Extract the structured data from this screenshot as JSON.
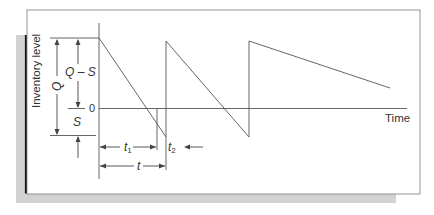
{
  "diagram": {
    "y_axis_label": "Inventory level",
    "x_axis_label": "Time",
    "zero_label": "0",
    "labels": {
      "Q": "Q",
      "Q_minus_S": "Q – S",
      "S": "S",
      "t1": "t",
      "t1_sub": "1",
      "t2": "t",
      "t2_sub": "2",
      "t": "t"
    },
    "colors": {
      "line": "#555555",
      "frame": "#8a8a8a",
      "shadow_dark": "#111111",
      "shadow_light": "#cfcfcf",
      "text": "#333333"
    },
    "cycles": [
      {
        "start_x": 99,
        "end_x": 166,
        "peak": "Q - S",
        "trough": "-S"
      },
      {
        "start_x": 166,
        "end_x": 249,
        "peak": "Q - S",
        "trough": "-S"
      },
      {
        "start_x": 249,
        "end_x": 390,
        "peak": "Q - S",
        "trough": "partial"
      }
    ]
  }
}
